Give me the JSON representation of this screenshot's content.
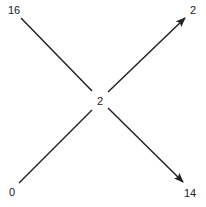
{
  "diagram": {
    "type": "directed-graph",
    "center_node": {
      "label": "2"
    },
    "nodes": [
      {
        "id": "tl",
        "label": "16"
      },
      {
        "id": "tr",
        "label": "2"
      },
      {
        "id": "bl",
        "label": "0"
      },
      {
        "id": "br",
        "label": "14"
      }
    ],
    "edges": [
      {
        "from": "16",
        "to": "2 (center)",
        "arrow": false
      },
      {
        "from": "0",
        "to": "2 (center)",
        "arrow": false
      },
      {
        "from": "2 (center)",
        "to": "2",
        "arrow": true
      },
      {
        "from": "2 (center)",
        "to": "14",
        "arrow": true
      }
    ],
    "colors": {
      "line": "#222222",
      "background": "#ffffff"
    }
  }
}
